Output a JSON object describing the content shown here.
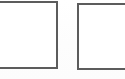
{
  "document": {
    "kind": "scanned-form-fragment",
    "background_color": "#fefefe",
    "width": 125,
    "height": 79
  },
  "ink": {
    "border_color": "#4a4a4a",
    "border_width_px": 2
  },
  "boxes": [
    {
      "name": "left-checkbox",
      "label": "",
      "value": "",
      "checked": false,
      "cropped_edge": "left",
      "x": -6,
      "y": 1,
      "width": 64,
      "height": 68
    },
    {
      "name": "right-checkbox",
      "label": "",
      "value": "",
      "checked": false,
      "cropped_edge": "right",
      "x": 77,
      "y": 3,
      "width": 56,
      "height": 67
    }
  ]
}
